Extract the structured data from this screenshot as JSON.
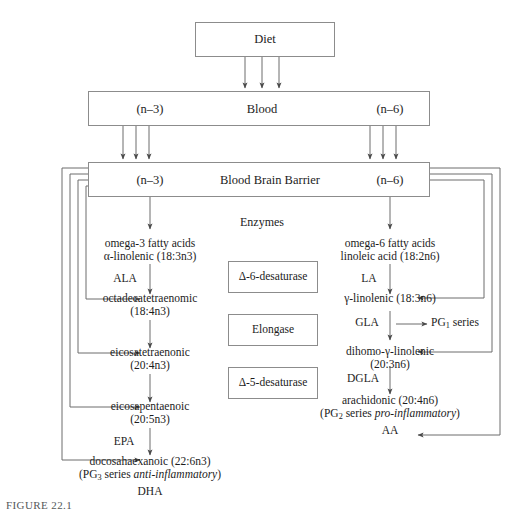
{
  "figure": {
    "caption": "FIGURE 22.1"
  },
  "boxes": {
    "diet": {
      "label": "Diet"
    },
    "blood": {
      "label": "Blood",
      "left_tag": "(n–3)",
      "right_tag": "(n–6)"
    },
    "bbb": {
      "label": "Blood Brain Barrier",
      "left_tag": "(n–3)",
      "right_tag": "(n–6)"
    }
  },
  "enzymes": {
    "heading": "Enzymes",
    "items": [
      {
        "label": "Δ-6-desaturase"
      },
      {
        "label": "Elongase"
      },
      {
        "label": "Δ-5-desaturase"
      }
    ]
  },
  "omega3": {
    "nodes": [
      {
        "lines": [
          "omega-3 fatty acids",
          "α-linolenic (18:3n3)"
        ],
        "abbrev": "ALA"
      },
      {
        "lines": [
          "octadecatetraenomic",
          "(18:4n3)"
        ],
        "abbrev": ""
      },
      {
        "lines": [
          "eicosatetraenonic",
          "(20:4n3)"
        ],
        "abbrev": ""
      },
      {
        "lines": [
          "eicosapentaenoic",
          "(20:5n3)"
        ],
        "abbrev": "EPA"
      },
      {
        "lines": [
          "docosahaexanoic (22:6n3)"
        ],
        "abbrev": "DHA"
      }
    ],
    "series_note_prefix": "(PG",
    "series_note_sub": "3",
    "series_note_mid": " series ",
    "series_note_italic": "anti-inflammatory",
    "series_note_suffix": ")"
  },
  "omega6": {
    "nodes": [
      {
        "lines": [
          "omega-6 fatty acids",
          "linoleic acid (18:2n6)"
        ],
        "abbrev": "LA"
      },
      {
        "lines": [
          "γ-linolenic (18:3n6)"
        ],
        "abbrev": "GLA"
      },
      {
        "lines": [
          "dihomo-γ-linolenic",
          "(20:3n6)"
        ],
        "abbrev": "DGLA"
      },
      {
        "lines": [
          "arachidonic (20:4n6)"
        ],
        "abbrev": "AA"
      }
    ],
    "pg1": {
      "prefix": "PG",
      "sub": "1",
      "suffix": " series"
    },
    "series_note_prefix": "(PG",
    "series_note_sub": "2",
    "series_note_mid": " series ",
    "series_note_italic": "pro-inflammatory",
    "series_note_suffix": ")"
  },
  "colors": {
    "stroke": "#6d6d6d",
    "box_border": "#8c8c8c",
    "text": "#1c1c1c",
    "background": "#ffffff"
  }
}
